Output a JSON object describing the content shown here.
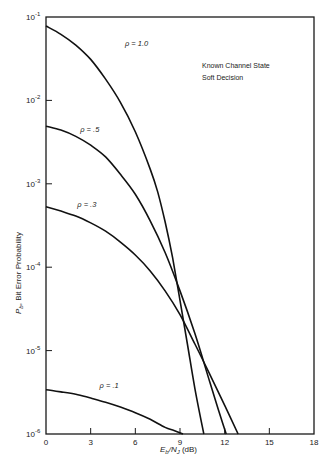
{
  "chart_data": {
    "type": "line",
    "title": "",
    "annotations": [
      "Known Channel State",
      "Soft Decision"
    ],
    "xlabel": "E_b/N_J (dB)",
    "xlabel_parts": {
      "main": "E",
      "sub1": "b",
      "slash": "/N",
      "sub2": "J",
      "unit": " (dB)"
    },
    "ylabel": "P_b, Bit Error Probability",
    "ylabel_parts": {
      "main": "P",
      "sub": "b",
      "rest": ", Bit Error Probability"
    },
    "xlim": [
      0,
      18
    ],
    "ylim": [
      1e-06,
      0.1
    ],
    "yscale": "log",
    "grid": false,
    "x_ticks": [
      0,
      3,
      6,
      9,
      12,
      15,
      18
    ],
    "x_tick_labels": [
      "0",
      "3",
      "6",
      "9",
      "12",
      "15",
      "18"
    ],
    "y_ticks": [
      0.1,
      0.01,
      0.001,
      0.0001,
      1e-05,
      1e-06
    ],
    "y_tick_labels": [
      {
        "base": "10",
        "exp": "-1"
      },
      {
        "base": "10",
        "exp": "-2"
      },
      {
        "base": "10",
        "exp": "-3"
      },
      {
        "base": "10",
        "exp": "-4"
      },
      {
        "base": "10",
        "exp": "-5"
      },
      {
        "base": "10",
        "exp": "-6"
      }
    ],
    "series": [
      {
        "name": "ρ = 1.0",
        "label": "ρ = 1.0",
        "label_pos": [
          5.3,
          0.045
        ],
        "x": [
          0,
          1,
          2,
          3,
          4,
          5,
          6,
          7,
          7.5,
          8,
          8.5,
          9,
          9.5,
          10,
          10.6
        ],
        "y": [
          0.078,
          0.062,
          0.046,
          0.031,
          0.018,
          0.0095,
          0.0042,
          0.0015,
          0.0008,
          0.00035,
          0.00013,
          4e-05,
          1.2e-05,
          3.5e-06,
          1e-06
        ]
      },
      {
        "name": "ρ = .5",
        "label": "ρ = .5",
        "label_pos": [
          2.3,
          0.0042
        ],
        "x": [
          0,
          1,
          2,
          3,
          4,
          5,
          6,
          7,
          8,
          9,
          10,
          11,
          11.6,
          12.1
        ],
        "y": [
          0.0049,
          0.0044,
          0.0037,
          0.0029,
          0.0021,
          0.0013,
          0.00075,
          0.00036,
          0.00015,
          5.2e-05,
          1.6e-05,
          4.2e-06,
          1.9e-06,
          1e-06
        ]
      },
      {
        "name": "ρ = .3",
        "label": "ρ = .3",
        "label_pos": [
          2.1,
          0.00052
        ],
        "x": [
          0,
          1,
          2,
          3,
          4,
          5,
          6,
          7,
          8,
          9,
          10,
          11,
          12,
          12.9
        ],
        "y": [
          0.00053,
          0.00047,
          0.00041,
          0.00034,
          0.00027,
          0.0002,
          0.00014,
          9e-05,
          5.2e-05,
          2.7e-05,
          1.2e-05,
          5.2e-06,
          2.2e-06,
          1e-06
        ]
      },
      {
        "name": "ρ = .1",
        "label": "ρ = .1",
        "label_pos": [
          3.6,
          3.6e-06
        ],
        "x": [
          0,
          1,
          2,
          3,
          4,
          5,
          6,
          7,
          8,
          8.6,
          9.2
        ],
        "y": [
          3.4e-06,
          3.2e-06,
          3e-06,
          2.7e-06,
          2.4e-06,
          2.1e-06,
          1.8e-06,
          1.5e-06,
          1.2e-06,
          1.1e-06,
          1e-06
        ]
      }
    ]
  },
  "layout": {
    "plot_left": 46,
    "plot_right": 314,
    "plot_top": 17,
    "plot_bottom": 434
  }
}
